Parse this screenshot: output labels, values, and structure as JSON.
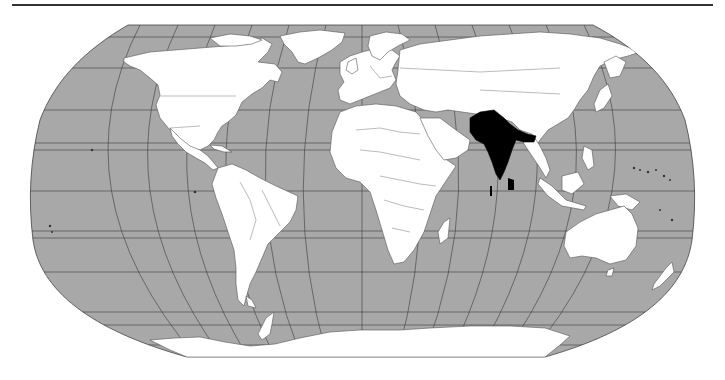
{
  "map": {
    "projection": "Robinson",
    "subject": "World map with South Asia highlighted",
    "highlighted_region": "South Asia",
    "colors": {
      "ocean": "#a8a8a8",
      "land": "#ffffff",
      "highlight": "#000000",
      "graticule": "#3a3a3a",
      "borders": "#555555",
      "top_rule": "#333333"
    },
    "highlighted_countries": [
      "Afghanistan",
      "Pakistan",
      "India",
      "Nepal",
      "Bhutan",
      "Bangladesh",
      "Sri Lanka",
      "Maldives"
    ]
  }
}
